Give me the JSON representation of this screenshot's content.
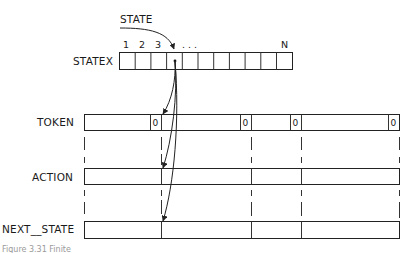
{
  "labels": {
    "state": "STATE",
    "statex": "STATEX",
    "token": "TOKEN",
    "action": "ACTION",
    "next_state": "NEXT__STATE"
  },
  "statex": {
    "index_labels": [
      "1",
      "2",
      "3"
    ],
    "ellipsis": ". . .",
    "last_index": "N",
    "cell_count": 11,
    "pointer_cell": 3
  },
  "token": {
    "zero_marker": "0",
    "zero_cells": 4
  },
  "caption": "Figure 3.31  Finite"
}
